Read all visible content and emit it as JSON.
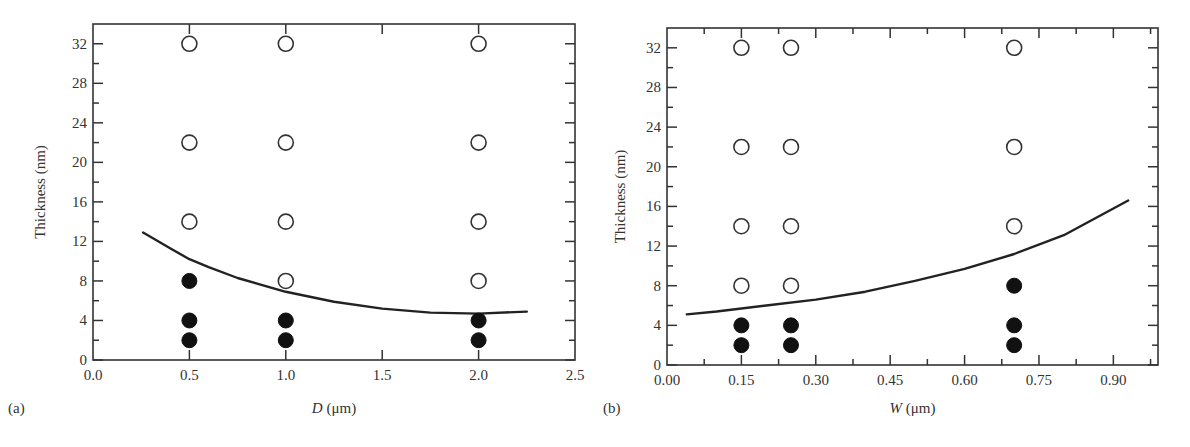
{
  "chart_data": [
    {
      "panel": "(a)",
      "type": "scatter",
      "xlabel_var": "D",
      "xlabel_unit": " (μm)",
      "ylabel": "Thickness (nm)",
      "xlim": [
        0.0,
        2.5
      ],
      "ylim": [
        0,
        34
      ],
      "xticks": [
        "0.0",
        "0.5",
        "1.0",
        "1.5",
        "2.0",
        "2.5"
      ],
      "yticks": [
        "0",
        "4",
        "8",
        "12",
        "16",
        "20",
        "24",
        "28",
        "32"
      ],
      "grid": false,
      "series": [
        {
          "name": "open",
          "marker": "open-circle",
          "points": [
            [
              0.5,
              32
            ],
            [
              0.5,
              22
            ],
            [
              0.5,
              14
            ],
            [
              1.0,
              32
            ],
            [
              1.0,
              22
            ],
            [
              1.0,
              14
            ],
            [
              1.0,
              8
            ],
            [
              2.0,
              32
            ],
            [
              2.0,
              22
            ],
            [
              2.0,
              14
            ],
            [
              2.0,
              8
            ]
          ]
        },
        {
          "name": "filled",
          "marker": "filled-circle",
          "points": [
            [
              0.5,
              8
            ],
            [
              0.5,
              4
            ],
            [
              0.5,
              2
            ],
            [
              1.0,
              4
            ],
            [
              1.0,
              2
            ],
            [
              2.0,
              4
            ],
            [
              2.0,
              2
            ]
          ]
        },
        {
          "name": "boundary-curve",
          "marker": "line",
          "points": [
            [
              0.26,
              12.9
            ],
            [
              0.4,
              11.3
            ],
            [
              0.5,
              10.2
            ],
            [
              0.6,
              9.4
            ],
            [
              0.75,
              8.3
            ],
            [
              1.0,
              6.9
            ],
            [
              1.25,
              5.9
            ],
            [
              1.5,
              5.2
            ],
            [
              1.75,
              4.8
            ],
            [
              2.0,
              4.7
            ],
            [
              2.25,
              4.9
            ]
          ]
        }
      ]
    },
    {
      "panel": "(b)",
      "type": "scatter",
      "xlabel_var": "W",
      "xlabel_unit": " (μm)",
      "ylabel": "Thickness (nm)",
      "xlim": [
        0.0,
        0.99
      ],
      "ylim": [
        0,
        34
      ],
      "xticks": [
        "0.00",
        "0.15",
        "0.30",
        "0.45",
        "0.60",
        "0.75",
        "0.90"
      ],
      "yticks": [
        "0",
        "4",
        "8",
        "12",
        "16",
        "20",
        "24",
        "28",
        "32"
      ],
      "grid": false,
      "series": [
        {
          "name": "open",
          "marker": "open-circle",
          "points": [
            [
              0.15,
              32
            ],
            [
              0.15,
              22
            ],
            [
              0.15,
              14
            ],
            [
              0.15,
              8
            ],
            [
              0.25,
              32
            ],
            [
              0.25,
              22
            ],
            [
              0.25,
              14
            ],
            [
              0.25,
              8
            ],
            [
              0.7,
              32
            ],
            [
              0.7,
              22
            ],
            [
              0.7,
              14
            ]
          ]
        },
        {
          "name": "filled",
          "marker": "filled-circle",
          "points": [
            [
              0.15,
              4
            ],
            [
              0.15,
              2
            ],
            [
              0.25,
              4
            ],
            [
              0.25,
              2
            ],
            [
              0.7,
              8
            ],
            [
              0.7,
              4
            ],
            [
              0.7,
              2
            ]
          ]
        },
        {
          "name": "boundary-curve",
          "marker": "line",
          "points": [
            [
              0.04,
              5.1
            ],
            [
              0.1,
              5.4
            ],
            [
              0.2,
              6.0
            ],
            [
              0.3,
              6.6
            ],
            [
              0.4,
              7.4
            ],
            [
              0.5,
              8.5
            ],
            [
              0.6,
              9.7
            ],
            [
              0.7,
              11.2
            ],
            [
              0.8,
              13.1
            ],
            [
              0.93,
              16.6
            ]
          ]
        }
      ]
    }
  ]
}
